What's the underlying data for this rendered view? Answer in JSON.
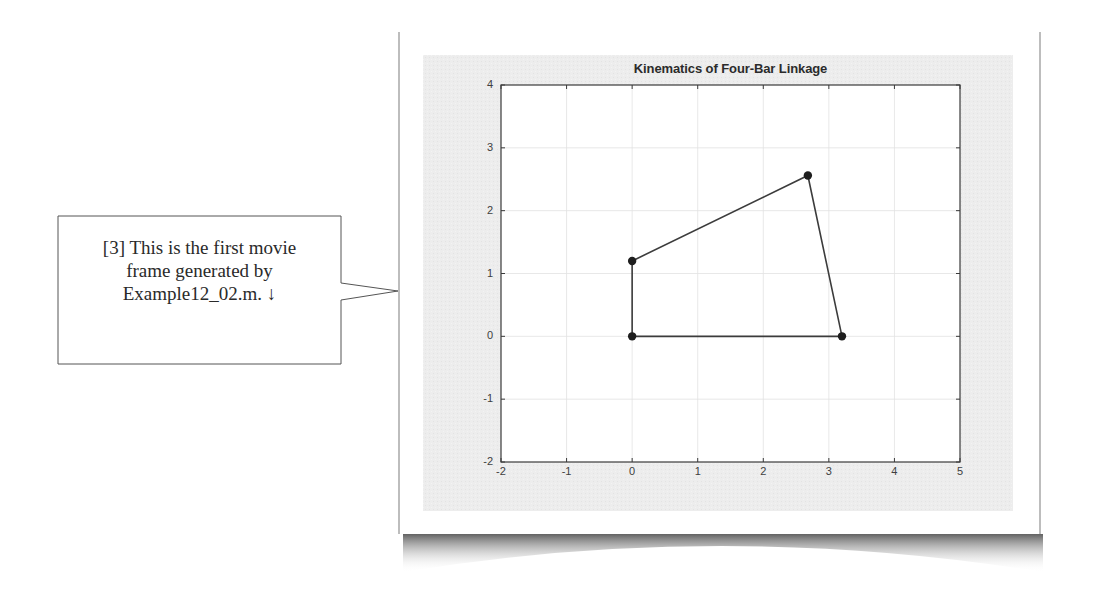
{
  "callout": {
    "lines": [
      "[3] This is the first movie",
      "frame generated by",
      "Example12_02.m. ↓"
    ]
  },
  "figure": {
    "title": "Kinematics of Four-Bar Linkage"
  },
  "colors": {
    "figure_bg": "#ececec",
    "axes_bg": "#ffffff",
    "grid": "#e2e2e2",
    "axis_line": "#3a3a3a",
    "linkage": "#3c3c3c",
    "marker": "#1e1e1e",
    "callout_border": "#555555",
    "card_border": "#bdbdbd",
    "shadow": "#6a6a6a"
  },
  "chart_data": {
    "type": "line",
    "title": "Kinematics of Four-Bar Linkage",
    "xlabel": "",
    "ylabel": "",
    "xlim": [
      -2,
      5
    ],
    "ylim": [
      -2,
      4
    ],
    "xticks": [
      -2,
      -1,
      0,
      1,
      2,
      3,
      4,
      5
    ],
    "yticks": [
      -2,
      -1,
      0,
      1,
      2,
      3,
      4
    ],
    "grid": true,
    "legend": null,
    "series": [
      {
        "name": "four-bar linkage",
        "marker": "filled-circle",
        "closed": true,
        "points": [
          {
            "label": "O2",
            "x": 0,
            "y": 0
          },
          {
            "label": "A",
            "x": 0,
            "y": 1.2
          },
          {
            "label": "B",
            "x": 2.68,
            "y": 2.56
          },
          {
            "label": "O4",
            "x": 3.2,
            "y": 0
          }
        ]
      }
    ]
  }
}
